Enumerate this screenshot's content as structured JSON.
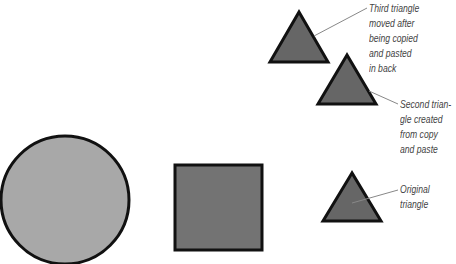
{
  "colors": {
    "circle_fill": "#a8a8a8",
    "square_fill": "#737373",
    "triangle_fill": "#666666",
    "stroke": "#111111",
    "leader": "#888888",
    "label_text": "#444444"
  },
  "shapes": {
    "circle": {
      "cx": 65,
      "cy": 200,
      "r": 64
    },
    "square": {
      "x": 175,
      "y": 165,
      "w": 87,
      "h": 85
    },
    "triangles": [
      {
        "id": "third",
        "points": "299,12 270,62 328,62"
      },
      {
        "id": "second",
        "points": "347,55 318,104 376,104"
      },
      {
        "id": "original",
        "points": "352,173 323,221 381,221"
      }
    ]
  },
  "annotations": [
    {
      "id": "third",
      "lines": [
        "Third triangle",
        "moved after",
        "being copied",
        "and pasted",
        "in back"
      ]
    },
    {
      "id": "second",
      "lines": [
        "Second trian-",
        "gle created",
        "from copy",
        "and paste"
      ]
    },
    {
      "id": "original",
      "lines": [
        "Original",
        "triangle"
      ]
    }
  ]
}
